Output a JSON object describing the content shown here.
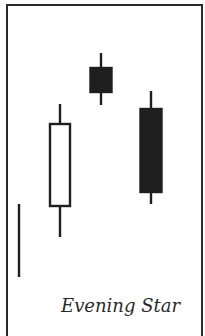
{
  "diagram": {
    "title": "Evening Star",
    "type": "candlestick-pattern",
    "colors": {
      "frame": "#2a2a2a",
      "ink": "#1f1f1f",
      "bullish_fill": "#ffffff",
      "bearish_fill": "#1f1f1f"
    },
    "trend_line": {
      "x": 19,
      "y1": 204,
      "y2": 277
    },
    "candles": [
      {
        "name": "white-candle",
        "kind": "bullish",
        "cx": 60,
        "body_top": 124,
        "body_bottom": 206,
        "wick_top": 104,
        "wick_bottom": 237,
        "body_width": 20
      },
      {
        "name": "star-candle",
        "kind": "bearish",
        "cx": 101,
        "body_top": 68,
        "body_bottom": 92,
        "wick_top": 53,
        "wick_bottom": 105,
        "body_width": 21
      },
      {
        "name": "black-candle",
        "kind": "bearish",
        "cx": 151,
        "body_top": 109,
        "body_bottom": 192,
        "wick_top": 91,
        "wick_bottom": 204,
        "body_width": 21
      }
    ]
  }
}
